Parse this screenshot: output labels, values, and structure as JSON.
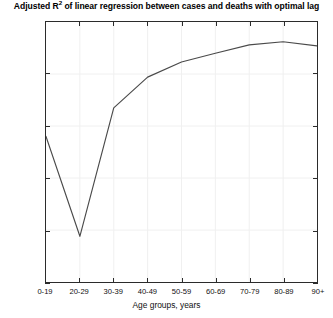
{
  "chart_data": {
    "type": "line",
    "title": "Adjusted R2 of linear regression between cases and deaths with optimal lag",
    "title_main": "Adjusted R",
    "title_sup": "2",
    "title_rest": " of linear regression between cases and deaths with optimal lag",
    "xlabel": "Age groups, years",
    "ylabel": "",
    "categories": [
      "0-19",
      "20-29",
      "30-39",
      "40-49",
      "50-59",
      "60-69",
      "70-79",
      "80-89",
      "90+"
    ],
    "values": [
      0.89,
      0.794,
      0.9175,
      0.947,
      0.9615,
      0.97,
      0.978,
      0.981,
      0.977
    ],
    "series": [
      {
        "name": "Adjusted R2",
        "values": [
          0.89,
          0.794,
          0.9175,
          0.947,
          0.9615,
          0.97,
          0.978,
          0.981,
          0.977
        ]
      }
    ],
    "ylim": [
      0.75,
      1
    ],
    "yticks": [
      1,
      0.95,
      0.9,
      0.85,
      0.8,
      0.75
    ],
    "ytick_labels": [
      "1",
      "0.95",
      "0.9",
      "0.85",
      "0.8",
      "0.75"
    ],
    "xticks": [
      0,
      1,
      2,
      3,
      4,
      5,
      6,
      7,
      8
    ],
    "xtick_labels": [
      "0-19",
      "20-29",
      "30-39",
      "40-49",
      "50-59",
      "60-69",
      "70-79",
      "80-89",
      "90+"
    ],
    "grid": true,
    "legend": "none",
    "line_color": "#4a4a4a",
    "axis_color": "#2b2b2b",
    "grid_color": "#f0f0f0",
    "background": "#ffffff"
  }
}
